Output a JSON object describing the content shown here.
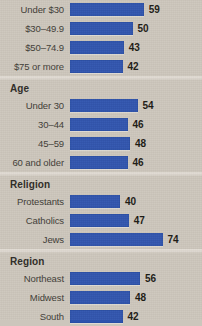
{
  "chart_data": {
    "type": "bar",
    "title": "",
    "xlabel": "",
    "ylabel": "",
    "orientation": "horizontal",
    "grid": false,
    "legend": null,
    "xlim": [
      0,
      80
    ],
    "value_suffix": "",
    "bar_color": "#2d52ad",
    "background_color": "#ccc6bc",
    "groups": [
      {
        "name": "",
        "header_visible": false,
        "categories": [
          "Under $30",
          "$30–49.9",
          "$50–74.9",
          "$75 or more"
        ],
        "values": [
          59,
          50,
          43,
          42
        ]
      },
      {
        "name": "Age",
        "header_visible": true,
        "categories": [
          "Under 30",
          "30–44",
          "45–59",
          "60 and older"
        ],
        "values": [
          54,
          46,
          48,
          46
        ]
      },
      {
        "name": "Religion",
        "header_visible": true,
        "categories": [
          "Protestants",
          "Catholics",
          "Jews"
        ],
        "values": [
          40,
          47,
          74
        ]
      },
      {
        "name": "Region",
        "header_visible": true,
        "categories": [
          "Northeast",
          "Midwest",
          "South"
        ],
        "values": [
          56,
          48,
          42
        ]
      }
    ]
  }
}
